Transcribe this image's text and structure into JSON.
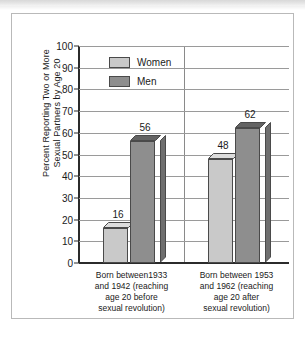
{
  "chart_data": {
    "type": "bar",
    "title": "",
    "xlabel": "",
    "ylabel": "Percent Reporting Two or More Sexual Partners by Age 20",
    "ylabel_lines": [
      "Percent Reporting Two or More",
      "Sexual Partners by Age 20"
    ],
    "categories": [
      "Born between1933 and 1942 (reaching age 20 before sexual revolution)",
      "Born between 1953 and 1962 (reaching age 20 after sexual revolution)"
    ],
    "category_lines": [
      [
        "Born between1933",
        "and 1942 (reaching",
        "age 20 before",
        "sexual revolution)"
      ],
      [
        "Born between 1953",
        "and 1962 (reaching",
        "age 20 after",
        "sexual revolution)"
      ]
    ],
    "series": [
      {
        "name": "Women",
        "values": [
          16,
          48
        ],
        "color": "#c9c9c9"
      },
      {
        "name": "Men",
        "values": [
          56,
          62
        ],
        "color": "#8e8e8e"
      }
    ],
    "ylim": [
      0,
      100
    ],
    "ytick_step": 10,
    "yticks": [
      0,
      10,
      20,
      30,
      40,
      50,
      60,
      70,
      80,
      90,
      100
    ],
    "ytick_labels": [
      "0",
      "10",
      "20",
      "30",
      "40",
      "50",
      "60",
      "70",
      "80",
      "90",
      "100"
    ],
    "grid": true,
    "grid_axis": "y",
    "legend_position": "top-left-inside",
    "bar_style": "3d",
    "data_labels": [
      16,
      56,
      48,
      62
    ]
  },
  "legend": {
    "entries": [
      {
        "label": "Women"
      },
      {
        "label": "Men"
      }
    ]
  },
  "colors": {
    "women": "#c9c9c9",
    "men": "#8e8e8e",
    "bar_outline": "#4a4a4a",
    "gridline": "#9a9a9a",
    "axis": "#2b2b2b",
    "card_border": "#b9b9b9",
    "text": "#1a1a1a"
  }
}
